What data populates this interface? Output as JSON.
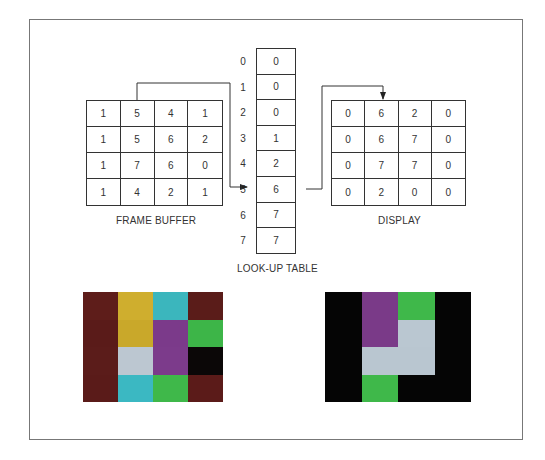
{
  "frame_buffer": {
    "label": "FRAME BUFFER",
    "rows": [
      [
        "1",
        "5",
        "4",
        "1"
      ],
      [
        "1",
        "5",
        "6",
        "2"
      ],
      [
        "1",
        "7",
        "6",
        "0"
      ],
      [
        "1",
        "4",
        "2",
        "1"
      ]
    ]
  },
  "lookup_table": {
    "label": "LOOK-UP TABLE",
    "indices": [
      "0",
      "1",
      "2",
      "3",
      "4",
      "5",
      "6",
      "7"
    ],
    "values": [
      "0",
      "0",
      "0",
      "1",
      "2",
      "6",
      "7",
      "7"
    ],
    "highlighted_index": 5
  },
  "display": {
    "label": "DISPLAY",
    "rows": [
      [
        "0",
        "6",
        "2",
        "0"
      ],
      [
        "0",
        "6",
        "7",
        "0"
      ],
      [
        "0",
        "7",
        "7",
        "0"
      ],
      [
        "0",
        "2",
        "0",
        "0"
      ]
    ]
  },
  "palette": {
    "0": "#0a0606",
    "1": "#5a1a18",
    "2": "#3fb84a",
    "4": "#3ab8c0",
    "5": "#c9a82a",
    "6": "#7a3a88",
    "7": "#b9c6d0"
  },
  "photo_left": {
    "colors": [
      [
        "#5e1d1a",
        "#cfae2e",
        "#3bb6bd",
        "#5a1c19"
      ],
      [
        "#5a1b19",
        "#c9a82a",
        "#7b3a8a",
        "#3db548"
      ],
      [
        "#5b1c1a",
        "#bcc7d1",
        "#7c3b8b",
        "#0b0707"
      ],
      [
        "#5a1b19",
        "#3bb8c2",
        "#3fb84a",
        "#5b1b19"
      ]
    ]
  },
  "photo_right": {
    "colors": [
      [
        "#050505",
        "#7a3a88",
        "#3fb84a",
        "#050505"
      ],
      [
        "#050505",
        "#7a3a88",
        "#bac7d1",
        "#050505"
      ],
      [
        "#050505",
        "#b9c6d0",
        "#b9c6d0",
        "#050505"
      ],
      [
        "#050505",
        "#3fb84a",
        "#050505",
        "#050505"
      ]
    ]
  }
}
